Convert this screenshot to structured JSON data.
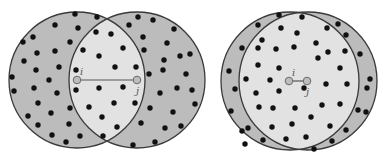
{
  "colors": {
    "background": "#ffffff",
    "outer_region": "#bcbcbc",
    "overlap_region": "#e2e2e2",
    "stroke": "#3a3a3a",
    "dot": "#111111",
    "node_fill": "#bdbdbd",
    "node_stroke": "#6a6a6a",
    "edge": "#555555"
  },
  "figures": [
    {
      "id": "left",
      "description": "Two nodes far apart: small overlap of neighborhoods",
      "circle_i": {
        "cx": 77,
        "cy": 80,
        "r": 68
      },
      "circle_j": {
        "cx": 137,
        "cy": 80,
        "r": 68
      },
      "node_i": {
        "x": 77,
        "y": 80,
        "label": "i"
      },
      "node_j": {
        "x": 137,
        "y": 80,
        "label": "j"
      },
      "dots": [
        [
          75,
          14
        ],
        [
          97,
          17
        ],
        [
          55,
          25
        ],
        [
          78,
          28
        ],
        [
          23,
          42
        ],
        [
          33,
          37
        ],
        [
          70,
          42
        ],
        [
          96,
          32
        ],
        [
          111,
          34
        ],
        [
          37,
          53
        ],
        [
          55,
          51
        ],
        [
          83,
          50
        ],
        [
          99,
          56
        ],
        [
          123,
          48
        ],
        [
          24,
          61
        ],
        [
          36,
          70
        ],
        [
          59,
          67
        ],
        [
          49,
          80
        ],
        [
          76,
          70
        ],
        [
          115,
          67
        ],
        [
          136,
          67
        ],
        [
          12,
          77
        ],
        [
          14,
          91
        ],
        [
          34,
          88
        ],
        [
          57,
          93
        ],
        [
          76,
          90
        ],
        [
          99,
          88
        ],
        [
          123,
          87
        ],
        [
          38,
          103
        ],
        [
          89,
          107
        ],
        [
          70,
          108
        ],
        [
          114,
          103
        ],
        [
          135,
          103
        ],
        [
          28,
          116
        ],
        [
          51,
          113
        ],
        [
          102,
          117
        ],
        [
          38,
          125
        ],
        [
          69,
          124
        ],
        [
          117,
          127
        ],
        [
          52,
          135
        ],
        [
          80,
          136
        ],
        [
          103,
          136
        ],
        [
          66,
          142
        ],
        [
          138,
          17
        ],
        [
          153,
          20
        ],
        [
          174,
          29
        ],
        [
          129,
          25
        ],
        [
          143,
          37
        ],
        [
          167,
          43
        ],
        [
          190,
          54
        ],
        [
          144,
          50
        ],
        [
          164,
          60
        ],
        [
          180,
          56
        ],
        [
          163,
          70
        ],
        [
          186,
          74
        ],
        [
          149,
          74
        ],
        [
          177,
          88
        ],
        [
          160,
          93
        ],
        [
          192,
          90
        ],
        [
          150,
          108
        ],
        [
          173,
          112
        ],
        [
          195,
          104
        ],
        [
          141,
          123
        ],
        [
          165,
          128
        ],
        [
          181,
          126
        ],
        [
          155,
          142
        ],
        [
          133,
          145
        ]
      ]
    },
    {
      "id": "right",
      "description": "Two nodes close together: large overlap of neighborhoods",
      "circle_i": {
        "cx": 290,
        "cy": 81,
        "r": 69
      },
      "circle_j": {
        "cx": 308,
        "cy": 81,
        "r": 69
      },
      "outer_circle": {
        "cx": 299,
        "cy": 81,
        "rx": 78,
        "ry": 70
      },
      "node_i": {
        "x": 289,
        "y": 81,
        "label": "i"
      },
      "node_j": {
        "x": 307,
        "y": 81,
        "label": "j"
      },
      "dots": [
        [
          279,
          15
        ],
        [
          302,
          17
        ],
        [
          258,
          25
        ],
        [
          281,
          28
        ],
        [
          327,
          28
        ],
        [
          338,
          24
        ],
        [
          242,
          48
        ],
        [
          262,
          40
        ],
        [
          297,
          33
        ],
        [
          346,
          35
        ],
        [
          360,
          54
        ],
        [
          258,
          48
        ],
        [
          276,
          49
        ],
        [
          294,
          47
        ],
        [
          316,
          43
        ],
        [
          328,
          52
        ],
        [
          345,
          51
        ],
        [
          258,
          65
        ],
        [
          279,
          68
        ],
        [
          318,
          58
        ],
        [
          340,
          68
        ],
        [
          229,
          71
        ],
        [
          246,
          79
        ],
        [
          270,
          80
        ],
        [
          304,
          88
        ],
        [
          326,
          84
        ],
        [
          347,
          84
        ],
        [
          370,
          79
        ],
        [
          235,
          89
        ],
        [
          256,
          93
        ],
        [
          279,
          91
        ],
        [
          322,
          105
        ],
        [
          367,
          88
        ],
        [
          231,
          111
        ],
        [
          259,
          107
        ],
        [
          273,
          108
        ],
        [
          295,
          108
        ],
        [
          340,
          104
        ],
        [
          358,
          110
        ],
        [
          248,
          128
        ],
        [
          272,
          127
        ],
        [
          292,
          124
        ],
        [
          311,
          117
        ],
        [
          330,
          126
        ],
        [
          366,
          112
        ],
        [
          242,
          131
        ],
        [
          263,
          140
        ],
        [
          286,
          139
        ],
        [
          306,
          137
        ],
        [
          332,
          141
        ],
        [
          346,
          130
        ],
        [
          245,
          144
        ],
        [
          314,
          149
        ]
      ]
    }
  ]
}
